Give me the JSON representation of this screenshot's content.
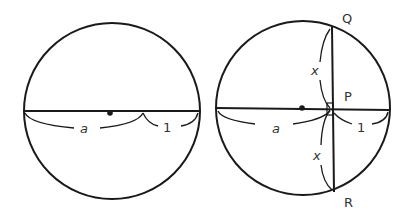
{
  "figure": {
    "left": {
      "labels": {
        "a": "a",
        "one": "1"
      }
    },
    "right": {
      "labels": {
        "a": "a",
        "one": "1",
        "x_top": "x",
        "x_bottom": "x",
        "P": "P",
        "Q": "Q",
        "R": "R"
      }
    },
    "colors": {
      "stroke": "#1a1a1a",
      "background": "#ffffff"
    }
  }
}
